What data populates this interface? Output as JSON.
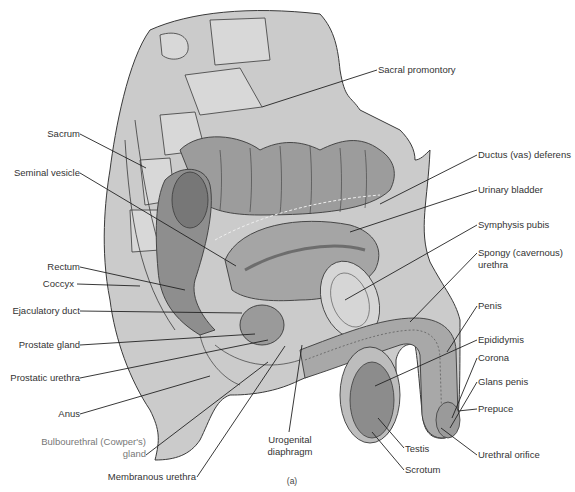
{
  "figure": {
    "caption": "(a)",
    "width": 575,
    "height": 492,
    "colors": {
      "tissue_light": "#c9c9c9",
      "tissue_mid": "#a9a9a9",
      "tissue_dark": "#8a8a8a",
      "outline": "#3a3a3a",
      "leader": "#222222",
      "text": "#333333",
      "background": "#ffffff"
    }
  },
  "labels": [
    {
      "id": "sacral-promontory",
      "text": "Sacral promontory",
      "x": 378,
      "y": 64,
      "align": "left",
      "line": [
        377,
        70,
        262,
        107
      ]
    },
    {
      "id": "sacrum",
      "text": "Sacrum",
      "x": 80,
      "y": 128,
      "align": "right",
      "line": [
        80,
        134,
        146,
        168
      ]
    },
    {
      "id": "seminal-vesicle",
      "text": "Seminal vesicle",
      "x": 80,
      "y": 167,
      "align": "right",
      "line": [
        80,
        173,
        236,
        266
      ]
    },
    {
      "id": "ductus-deferens",
      "text": "Ductus (vas) deferens",
      "x": 478,
      "y": 149,
      "align": "left",
      "line": [
        477,
        155,
        380,
        204
      ]
    },
    {
      "id": "urinary-bladder",
      "text": "Urinary bladder",
      "x": 478,
      "y": 184,
      "align": "left",
      "line": [
        477,
        190,
        350,
        232
      ]
    },
    {
      "id": "symphysis-pubis",
      "text": "Symphysis pubis",
      "x": 478,
      "y": 219,
      "align": "left",
      "line": [
        477,
        225,
        345,
        300
      ]
    },
    {
      "id": "spongy-urethra",
      "text": "Spongy (cavernous)",
      "text2": "urethra",
      "x": 478,
      "y": 247,
      "align": "left",
      "line": [
        477,
        253,
        410,
        322
      ]
    },
    {
      "id": "penis",
      "text": "Penis",
      "x": 478,
      "y": 300,
      "align": "left",
      "line": [
        477,
        306,
        447,
        352
      ]
    },
    {
      "id": "rectum",
      "text": "Rectum",
      "x": 80,
      "y": 261,
      "align": "right",
      "line": [
        80,
        267,
        185,
        290
      ]
    },
    {
      "id": "coccyx",
      "text": "Coccyx",
      "x": 74,
      "y": 278,
      "align": "right",
      "line": [
        77,
        284,
        140,
        286
      ]
    },
    {
      "id": "ejaculatory-duct",
      "text": "Ejaculatory duct",
      "x": 80,
      "y": 305,
      "align": "right",
      "line": [
        80,
        311,
        242,
        313
      ]
    },
    {
      "id": "prostate-gland",
      "text": "Prostate gland",
      "x": 80,
      "y": 339,
      "align": "right",
      "line": [
        80,
        345,
        255,
        334
      ]
    },
    {
      "id": "prostatic-urethra",
      "text": "Prostatic urethra",
      "x": 80,
      "y": 372,
      "align": "right",
      "line": [
        80,
        378,
        268,
        340
      ]
    },
    {
      "id": "anus",
      "text": "Anus",
      "x": 80,
      "y": 408,
      "align": "right",
      "line": [
        80,
        414,
        210,
        376
      ]
    },
    {
      "id": "bulbourethral-gland",
      "text": "Bulbourethral (Cowper's)",
      "text2": "gland",
      "x": 146,
      "y": 436,
      "align": "right",
      "faint": true,
      "line": [
        146,
        455,
        268,
        362
      ]
    },
    {
      "id": "membranous-urethra",
      "text": "Membranous urethra",
      "x": 196,
      "y": 471,
      "align": "right",
      "line": [
        197,
        477,
        285,
        346
      ]
    },
    {
      "id": "urogenital-diaphragm",
      "text": "Urogenital",
      "text2": "diaphragm",
      "x": 290,
      "y": 434,
      "align": "center",
      "line": [
        289,
        432,
        302,
        345
      ]
    },
    {
      "id": "epididymis",
      "text": "Epididymis",
      "x": 478,
      "y": 334,
      "align": "left",
      "line": [
        477,
        340,
        375,
        386
      ]
    },
    {
      "id": "corona",
      "text": "Corona",
      "x": 478,
      "y": 352,
      "align": "left",
      "line": [
        477,
        358,
        452,
        418
      ]
    },
    {
      "id": "glans-penis",
      "text": "Glans penis",
      "x": 478,
      "y": 376,
      "align": "left",
      "line": [
        477,
        382,
        450,
        428
      ]
    },
    {
      "id": "prepuce",
      "text": "Prepuce",
      "x": 478,
      "y": 403,
      "align": "left",
      "line": [
        477,
        409,
        458,
        411
      ]
    },
    {
      "id": "testis",
      "text": "Testis",
      "x": 405,
      "y": 443,
      "align": "left",
      "line": [
        404,
        448,
        378,
        418
      ]
    },
    {
      "id": "urethral-orifice",
      "text": "Urethral orifice",
      "x": 478,
      "y": 449,
      "align": "left",
      "line": [
        477,
        455,
        441,
        428
      ]
    },
    {
      "id": "scrotum",
      "text": "Scrotum",
      "x": 405,
      "y": 464,
      "align": "left",
      "line": [
        404,
        470,
        372,
        432
      ]
    }
  ]
}
